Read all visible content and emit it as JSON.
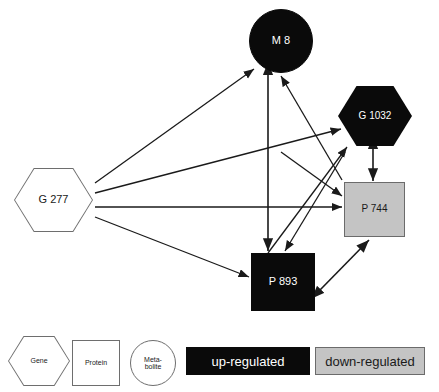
{
  "figure": {
    "type": "biological-network-diagram",
    "width": 439,
    "height": 392,
    "background": "#ffffff"
  },
  "colors": {
    "up_regulated_fill": "#0a0a0a",
    "up_regulated_text": "#ffffff",
    "down_regulated_fill": "#c4c4c4",
    "down_regulated_border": "#6b6b6b",
    "down_regulated_text": "#1a1a1a",
    "neutral_fill": "#ffffff",
    "neutral_border": "#6e6e6e",
    "neutral_text": "#1a1a1a",
    "edge_color": "#1a1a1a"
  },
  "nodes": [
    {
      "id": "g277",
      "label": "G 277",
      "shape": "hexagon",
      "entity": "Gene",
      "state": "neutral",
      "x": 14,
      "y": 168,
      "width": 79,
      "height": 64,
      "font_size": 11
    },
    {
      "id": "m8",
      "label": "M 8",
      "shape": "circle",
      "entity": "Metabolite",
      "state": "up-regulated",
      "x": 249,
      "y": 9,
      "width": 64,
      "height": 64,
      "font_size": 11
    },
    {
      "id": "g1032",
      "label": "G 1032",
      "shape": "hexagon",
      "entity": "Gene",
      "state": "up-regulated",
      "x": 338,
      "y": 86,
      "width": 74,
      "height": 60,
      "font_size": 10
    },
    {
      "id": "p744",
      "label": "P 744",
      "shape": "square",
      "entity": "Protein",
      "state": "down-regulated",
      "x": 344,
      "y": 182,
      "width": 61,
      "height": 55,
      "font_size": 10
    },
    {
      "id": "p893",
      "label": "P 893",
      "shape": "square",
      "entity": "Protein",
      "state": "up-regulated",
      "x": 251,
      "y": 253,
      "width": 64,
      "height": 58,
      "font_size": 11
    }
  ],
  "edges": [
    {
      "from": "g277",
      "to": "m8",
      "direction": "single",
      "x1": 95,
      "y1": 183,
      "x2": 254,
      "y2": 69
    },
    {
      "from": "g277",
      "to": "g1032",
      "direction": "single",
      "x1": 95,
      "y1": 193,
      "x2": 341,
      "y2": 129
    },
    {
      "from": "g277",
      "to": "p744",
      "direction": "single",
      "x1": 95,
      "y1": 207,
      "x2": 342,
      "y2": 207
    },
    {
      "from": "g277",
      "to": "p893",
      "direction": "single",
      "x1": 95,
      "y1": 217,
      "x2": 249,
      "y2": 277
    },
    {
      "from": "m8",
      "to": "p893",
      "direction": "double",
      "x1": 268,
      "y1": 74,
      "x2": 268,
      "y2": 251
    },
    {
      "from": "p893",
      "to": "m8",
      "direction": "single",
      "x1": 342,
      "y1": 180,
      "x2": 281,
      "y2": 76
    },
    {
      "from": "g1032",
      "to": "p893",
      "direction": "single",
      "x1": 345,
      "y1": 152,
      "x2": 285,
      "y2": 251
    },
    {
      "from": "p893",
      "to": "g1032",
      "direction": "single",
      "x1": 268,
      "y1": 253,
      "x2": 347,
      "y2": 147
    },
    {
      "from": "m8",
      "to": "p744",
      "direction": "single",
      "x1": 281,
      "y1": 152,
      "x2": 342,
      "y2": 196
    },
    {
      "from": "g1032",
      "to": "p744",
      "direction": "double",
      "x1": 373,
      "y1": 148,
      "x2": 373,
      "y2": 181
    },
    {
      "from": "p893",
      "to": "p744",
      "direction": "double",
      "x1": 320,
      "y1": 290,
      "x2": 369,
      "y2": 240
    }
  ],
  "legend": {
    "shapes": [
      {
        "id": "legend-gene",
        "label": "Gene",
        "shape": "hexagon",
        "x": 8,
        "y": 336,
        "width": 62,
        "height": 50,
        "font_size": 7
      },
      {
        "id": "legend-protein",
        "label": "Protein",
        "shape": "square",
        "x": 72,
        "y": 340,
        "width": 48,
        "height": 46,
        "font_size": 7
      },
      {
        "id": "legend-metabolite",
        "label": "Meta-\nbolite",
        "shape": "circle",
        "x": 130,
        "y": 340,
        "width": 46,
        "height": 46,
        "font_size": 7
      }
    ],
    "bars": [
      {
        "id": "legend-up",
        "label": "up-regulated",
        "state": "up-regulated",
        "x": 186,
        "y": 347,
        "width": 124,
        "height": 28,
        "font_size": 13
      },
      {
        "id": "legend-down",
        "label": "down-regulated",
        "state": "down-regulated",
        "x": 315,
        "y": 347,
        "width": 110,
        "height": 28,
        "font_size": 13
      }
    ]
  }
}
